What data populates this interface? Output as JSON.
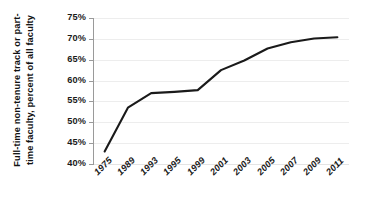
{
  "chart_data": {
    "type": "line",
    "title": "",
    "xlabel": "",
    "ylabel": "Full-time non-tenure track or part-time faculty, percent of all faculty",
    "ylabel_line1": "Full-time non-tenure track or part-",
    "ylabel_line2": "time faculty, percent of all faculty",
    "categories": [
      "1975",
      "1989",
      "1993",
      "1995",
      "1999",
      "2001",
      "2003",
      "2005",
      "2007",
      "2009",
      "2011"
    ],
    "values": [
      43.0,
      53.5,
      57.0,
      57.3,
      57.7,
      62.5,
      64.8,
      67.7,
      69.2,
      70.1,
      70.4
    ],
    "series": [
      {
        "name": "Full-time non-tenure track or part-time faculty",
        "values": [
          43.0,
          53.5,
          57.0,
          57.3,
          57.7,
          62.5,
          64.8,
          67.7,
          69.2,
          70.1,
          70.4
        ]
      }
    ],
    "ylim": [
      40,
      75
    ],
    "ytick_values": [
      40,
      45,
      50,
      55,
      60,
      65,
      70,
      75
    ],
    "ytick_labels": [
      "40%",
      "45%",
      "50%",
      "55%",
      "60%",
      "65%",
      "70%",
      "75%"
    ],
    "grid": true,
    "grid_axis": "y",
    "legend": false,
    "legend_position": "none",
    "line_color": "#1a1a1a",
    "grid_color": "#ededed",
    "axis_color": "#9a9a9a",
    "background_color": "#ffffff",
    "xtick_rotation": -45
  }
}
